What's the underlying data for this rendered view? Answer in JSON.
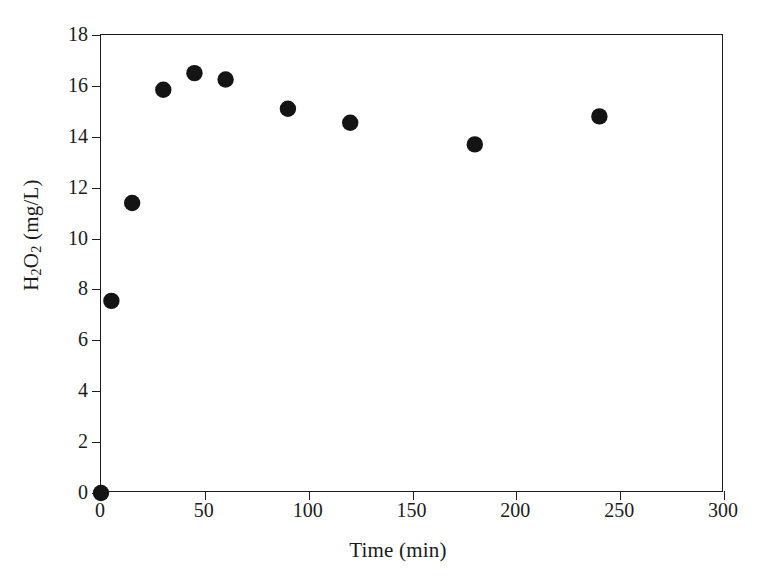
{
  "chart_data": {
    "type": "scatter",
    "title": "",
    "xlabel": "Time (min)",
    "ylabel": "H2O2 (mg/L)",
    "ylabel_parts": {
      "pre": "H",
      "sub1": "2",
      "mid": "O",
      "sub2": "2",
      "post": " (mg/L)"
    },
    "xlim": [
      0,
      300
    ],
    "ylim": [
      0,
      18
    ],
    "grid": false,
    "legend": null,
    "marker": "filled-circle",
    "marker_color": "#141414",
    "x": [
      0,
      5,
      15,
      30,
      45,
      60,
      90,
      120,
      180,
      240
    ],
    "values": [
      0,
      7.55,
      11.4,
      15.85,
      16.5,
      16.25,
      15.1,
      14.55,
      13.7,
      14.8
    ],
    "points": [
      {
        "x": 0,
        "y": 0
      },
      {
        "x": 5,
        "y": 7.55
      },
      {
        "x": 15,
        "y": 11.4
      },
      {
        "x": 30,
        "y": 15.85
      },
      {
        "x": 45,
        "y": 16.5
      },
      {
        "x": 60,
        "y": 16.25
      },
      {
        "x": 90,
        "y": 15.1
      },
      {
        "x": 120,
        "y": 14.55
      },
      {
        "x": 180,
        "y": 13.7
      },
      {
        "x": 240,
        "y": 14.8
      }
    ],
    "xticks": [
      0,
      50,
      100,
      150,
      200,
      250,
      300
    ],
    "xtick_labels": [
      "0",
      "50",
      "100",
      "150",
      "200",
      "250",
      "300"
    ],
    "yticks": [
      0,
      2,
      4,
      6,
      8,
      10,
      12,
      14,
      16,
      18
    ],
    "ytick_labels": [
      "0",
      "2",
      "4",
      "6",
      "8",
      "10",
      "12",
      "14",
      "16",
      "18"
    ]
  },
  "axes": {
    "x_title": "Time (min)",
    "y_title": "H2O2 (mg/L)"
  },
  "style": {
    "background": "#ffffff",
    "axis_color": "#1c1c1c",
    "marker_color": "#141414"
  }
}
